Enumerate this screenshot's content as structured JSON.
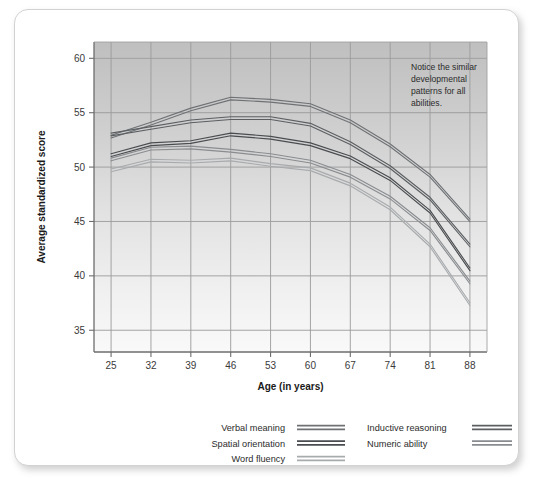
{
  "card": {
    "background": "#ffffff",
    "border_color": "#d2d2d2"
  },
  "annotation": {
    "line1": "Notice the similar",
    "line2": "developmental",
    "line3": "patterns for all",
    "line4": "abilities."
  },
  "axes": {
    "y_title": "Average standardized score",
    "x_title": "Age (in years)",
    "y_ticks": [
      "35",
      "40",
      "45",
      "50",
      "55",
      "60"
    ],
    "x_ticks": [
      "25",
      "32",
      "39",
      "46",
      "53",
      "60",
      "67",
      "74",
      "81",
      "88"
    ]
  },
  "legend": {
    "items": [
      {
        "label": "Verbal meaning",
        "color": "#6f7275"
      },
      {
        "label": "Spatial orientation",
        "color": "#4a4d50"
      },
      {
        "label": "Word fluency",
        "color": "#a8abad"
      },
      {
        "label": "Inductive reasoning",
        "color": "#5c5f62"
      },
      {
        "label": "Numeric ability",
        "color": "#8a8d90"
      }
    ]
  },
  "chart_data": {
    "type": "line",
    "title": "",
    "xlabel": "Age (in years)",
    "ylabel": "Average standardized score",
    "x": [
      25,
      32,
      39,
      46,
      53,
      60,
      67,
      74,
      81,
      88
    ],
    "xlim": [
      22,
      91
    ],
    "ylim": [
      33,
      61.5
    ],
    "grid": true,
    "legend_position": "below",
    "series": [
      {
        "name": "Verbal meaning",
        "color": "#6f7275",
        "values": [
          52.8,
          54.0,
          55.3,
          56.3,
          56.1,
          55.7,
          54.2,
          52.0,
          49.2,
          45.1
        ]
      },
      {
        "name": "Inductive reasoning",
        "color": "#5c5f62",
        "values": [
          53.0,
          53.6,
          54.2,
          54.5,
          54.5,
          53.9,
          52.2,
          50.0,
          47.1,
          42.8
        ]
      },
      {
        "name": "Spatial orientation",
        "color": "#4a4d50",
        "values": [
          51.1,
          52.1,
          52.3,
          53.0,
          52.7,
          52.1,
          50.9,
          48.9,
          45.9,
          40.6
        ]
      },
      {
        "name": "Numeric ability",
        "color": "#8a8d90",
        "values": [
          50.7,
          51.7,
          51.8,
          51.5,
          51.1,
          50.5,
          49.2,
          47.2,
          44.3,
          39.4
        ]
      },
      {
        "name": "Word fluency",
        "color": "#a8abad",
        "values": [
          49.7,
          50.6,
          50.5,
          50.7,
          50.2,
          49.8,
          48.4,
          46.2,
          42.8,
          37.4
        ]
      }
    ]
  },
  "plot_geometry": {
    "left": 79,
    "top": 32,
    "width": 393,
    "height": 310
  }
}
